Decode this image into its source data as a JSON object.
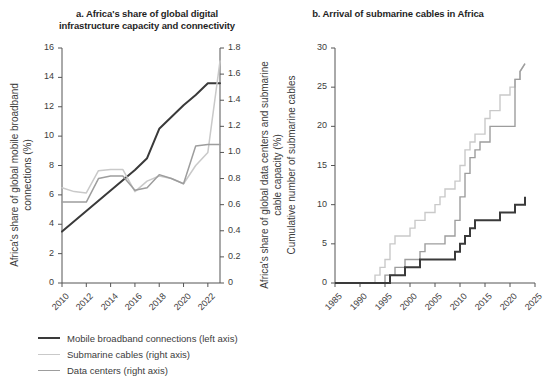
{
  "colors": {
    "dark": "#3a3a3a",
    "light": "#c9c9c9",
    "mid": "#9d9d9d",
    "axis": "#555555",
    "text": "#3c3c3c",
    "title": "#1f1f1f",
    "background": "#ffffff"
  },
  "panel_a": {
    "title": "a. Africa's share of global digital infrastructure capacity and connectivity",
    "left_axis_label": "Africa's share of global mobile broadband connections (%)",
    "right_axis_label": "Africa's share of global data centers and submarine cable capacity (%)",
    "legend": [
      {
        "label": "Mobile broadband connections (left axis)",
        "color": "#3a3a3a",
        "width": 2.2
      },
      {
        "label": "Submarine cables (right axis)",
        "color": "#c9c9c9",
        "width": 1.5
      },
      {
        "label": "Data centers (right axis)",
        "color": "#9d9d9d",
        "width": 1.5
      }
    ]
  },
  "panel_b": {
    "title": "b. Arrival of submarine cables in Africa",
    "y_axis_label": "Cumulative number of submarine cables",
    "legend": [
      {
        "label": "Domestic",
        "color": "#3a3a3a",
        "width": 2.2
      },
      {
        "label": "International (bilateral)",
        "color": "#c9c9c9",
        "width": 1.5
      },
      {
        "label": "International (multilateral)",
        "color": "#9d9d9d",
        "width": 1.5
      }
    ]
  },
  "chart_data": [
    {
      "id": "panel_a",
      "type": "line",
      "title": "a. Africa's share of global digital infrastructure capacity and connectivity",
      "xlabel": "",
      "ylabel": "Africa's share of global mobile broadband connections (%)",
      "y2label": "Africa's share of global data centers and submarine cable capacity (%)",
      "xlim": [
        2010,
        2023
      ],
      "ylim": [
        0,
        16
      ],
      "y2lim": [
        0,
        1.8
      ],
      "yticks": [
        0,
        2,
        4,
        6,
        8,
        10,
        12,
        14,
        16
      ],
      "y2ticks": [
        0,
        0.2,
        0.4,
        0.6,
        0.8,
        1.0,
        1.2,
        1.4,
        1.6,
        1.8
      ],
      "xticks": [
        2010,
        2012,
        2014,
        2016,
        2018,
        2020,
        2022
      ],
      "grid": false,
      "legend_position": "below",
      "x": [
        2010,
        2011,
        2012,
        2013,
        2014,
        2015,
        2016,
        2017,
        2018,
        2019,
        2020,
        2021,
        2022,
        2023
      ],
      "series": [
        {
          "name": "Mobile broadband connections (left axis)",
          "axis": "left",
          "units": "%",
          "color": "#3a3a3a",
          "values": [
            3.5,
            4.2,
            4.9,
            5.6,
            6.3,
            7.0,
            7.7,
            8.5,
            10.5,
            11.3,
            12.1,
            12.8,
            13.6,
            13.6
          ]
        },
        {
          "name": "Submarine cables (right axis)",
          "axis": "right",
          "units": "%",
          "color": "#c9c9c9",
          "values": [
            0.73,
            0.7,
            0.69,
            0.86,
            0.87,
            0.87,
            0.7,
            0.78,
            0.82,
            0.8,
            0.76,
            0.9,
            1.0,
            1.7
          ]
        },
        {
          "name": "Data centers (right axis)",
          "axis": "right",
          "units": "%",
          "color": "#9d9d9d",
          "values": [
            0.62,
            0.62,
            0.62,
            0.8,
            0.82,
            0.82,
            0.71,
            0.73,
            0.83,
            0.8,
            0.76,
            1.05,
            1.06,
            1.06
          ]
        }
      ]
    },
    {
      "id": "panel_b",
      "type": "line",
      "title": "b. Arrival of submarine cables in Africa",
      "xlabel": "",
      "ylabel": "Cumulative number of submarine cables",
      "xlim": [
        1985,
        2025
      ],
      "ylim": [
        0,
        30
      ],
      "yticks": [
        0,
        5,
        10,
        15,
        20,
        25,
        30
      ],
      "xticks": [
        1985,
        1990,
        1995,
        2000,
        2005,
        2010,
        2015,
        2020,
        2025
      ],
      "grid": false,
      "legend_position": "below",
      "series": [
        {
          "name": "Domestic",
          "color": "#3a3a3a",
          "units": "cables",
          "x": [
            1985,
            1996,
            1996,
            1999,
            1999,
            2002,
            2002,
            2009,
            2009,
            2010,
            2010,
            2011,
            2011,
            2012,
            2012,
            2013,
            2013,
            2018,
            2018,
            2019,
            2019,
            2021,
            2021,
            2023,
            2023
          ],
          "values": [
            0,
            0,
            1,
            1,
            2,
            2,
            3,
            3,
            4,
            4,
            5,
            5,
            6,
            6,
            7,
            7,
            8,
            8,
            9,
            9,
            9,
            9,
            10,
            10,
            11
          ]
        },
        {
          "name": "International (bilateral)",
          "color": "#c9c9c9",
          "units": "cables",
          "x": [
            1985,
            1993,
            1993,
            1994,
            1994,
            1995,
            1995,
            1996,
            1996,
            1997,
            1997,
            2000,
            2000,
            2001,
            2001,
            2002,
            2002,
            2003,
            2003,
            2005,
            2005,
            2006,
            2006,
            2007,
            2007,
            2008,
            2008,
            2009,
            2009,
            2010,
            2010,
            2011,
            2011,
            2012,
            2012,
            2013,
            2013,
            2015,
            2015,
            2016,
            2016,
            2018,
            2018,
            2020,
            2020,
            2021,
            2021,
            2022,
            2022,
            2023
          ],
          "values": [
            0,
            0,
            1,
            1,
            2,
            2,
            3,
            3,
            5,
            5,
            6,
            6,
            7,
            7,
            8,
            8,
            8,
            8,
            9,
            9,
            10,
            10,
            11,
            11,
            12,
            12,
            12,
            12,
            13,
            13,
            15,
            15,
            17,
            17,
            18,
            18,
            19,
            19,
            21,
            21,
            22,
            22,
            24,
            24,
            25,
            25,
            26,
            26,
            27,
            28
          ]
        },
        {
          "name": "International (multilateral)",
          "color": "#9d9d9d",
          "units": "cables",
          "x": [
            1985,
            1995,
            1995,
            1997,
            1997,
            1999,
            1999,
            2000,
            2000,
            2002,
            2002,
            2003,
            2003,
            2007,
            2007,
            2008,
            2008,
            2009,
            2009,
            2010,
            2010,
            2011,
            2011,
            2012,
            2012,
            2013,
            2013,
            2014,
            2014,
            2016,
            2016,
            2018,
            2018,
            2021,
            2021,
            2022,
            2022,
            2023
          ],
          "values": [
            0,
            0,
            1,
            1,
            2,
            2,
            3,
            3,
            3,
            3,
            4,
            4,
            5,
            5,
            6,
            6,
            6,
            6,
            8,
            8,
            11,
            11,
            14,
            14,
            16,
            16,
            17,
            17,
            18,
            18,
            20,
            20,
            20,
            20,
            26,
            26,
            27,
            28
          ]
        }
      ]
    }
  ]
}
